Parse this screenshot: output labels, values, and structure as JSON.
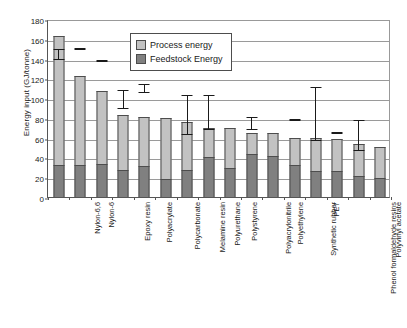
{
  "chart_data": {
    "type": "bar",
    "title": "",
    "subtitle": "",
    "xlabel": "",
    "ylabel": "Energy input (GJ/tonne)",
    "ylim": [
      0,
      180
    ],
    "ytick_values": [
      0,
      20,
      40,
      60,
      80,
      100,
      120,
      140,
      160,
      180
    ],
    "ytick_labels": [
      "0",
      "20",
      "40",
      "60",
      "80",
      "100",
      "120",
      "140",
      "160",
      "180"
    ],
    "grid": true,
    "stacked": true,
    "legend_position": "upper-center",
    "legend": [
      "Process energy",
      "Feedstock Energy"
    ],
    "categories": [
      "Nylon-6,6",
      "Nylon-6",
      "Epoxy resin",
      "Polyacrylate",
      "Polycarbonate",
      "Melamine resin",
      "Polyurethane",
      "Polystyrene",
      "Polyacrylonitrile",
      "Polyethylene",
      "Synthetic rubber",
      "Phenol formaldehyde resins",
      "PET",
      "Polyvinyl acetate",
      "Polyvinyl chloride",
      "Urea resin"
    ],
    "series": [
      {
        "name": "Feedstock Energy",
        "color": "#808080",
        "values": [
          32,
          32,
          33.5,
          27,
          31.5,
          18.5,
          27,
          40,
          29,
          43,
          41,
          32.5,
          26.5,
          26.5,
          21,
          19
        ]
      },
      {
        "name": "Process energy",
        "color": "#c2c2c2",
        "values": [
          130.5,
          90.5,
          73.5,
          55.5,
          49,
          61.5,
          49,
          30,
          40.5,
          22,
          23.5,
          27.5,
          33.5,
          32,
          33,
          32
        ]
      }
    ],
    "totals": [
      162.5,
      122.5,
      107,
      82.5,
      80.5,
      80,
      76,
      70,
      69.5,
      65,
      64.5,
      60,
      60,
      58.5,
      54,
      51
    ],
    "error_bars": [
      {
        "category": "Nylon-6,6",
        "low": 141,
        "high": 152,
        "type": "range"
      },
      {
        "category": "Nylon-6",
        "low": 153,
        "high": 153,
        "type": "marker"
      },
      {
        "category": "Epoxy resin",
        "low": 140.5,
        "high": 140.5,
        "type": "marker"
      },
      {
        "category": "Polyacrylate",
        "low": 91,
        "high": 110,
        "type": "range"
      },
      {
        "category": "Polycarbonate",
        "low": 107,
        "high": 116,
        "type": "range"
      },
      {
        "category": "Melamine resin",
        "low": null,
        "high": null,
        "type": "none"
      },
      {
        "category": "Polyurethane",
        "low": 65,
        "high": 105,
        "type": "range"
      },
      {
        "category": "Polystyrene",
        "low": 70,
        "high": 105.5,
        "type": "range"
      },
      {
        "category": "Polyacrylonitrile",
        "low": null,
        "high": null,
        "type": "none"
      },
      {
        "category": "Polyethylene",
        "low": 70,
        "high": 83,
        "type": "range"
      },
      {
        "category": "Synthetic rubber",
        "low": null,
        "high": null,
        "type": "none"
      },
      {
        "category": "Phenol formaldehyde resins",
        "low": 80.5,
        "high": 80.5,
        "type": "marker"
      },
      {
        "category": "PET",
        "low": 59,
        "high": 113,
        "type": "range"
      },
      {
        "category": "Polyvinyl acetate",
        "low": 67.5,
        "high": 67.5,
        "type": "marker"
      },
      {
        "category": "Polyvinyl chloride",
        "low": 49,
        "high": 79.5,
        "type": "range"
      },
      {
        "category": "Urea resin",
        "low": null,
        "high": null,
        "type": "none"
      }
    ],
    "colors": {
      "process_energy": "#c2c2c2",
      "feedstock_energy": "#808080",
      "axis": "#555555",
      "gridline": "#9a9a9a",
      "bar_border": "#4d4d4d",
      "error_bar": "#1a1a1a",
      "background": "#ffffff"
    }
  }
}
